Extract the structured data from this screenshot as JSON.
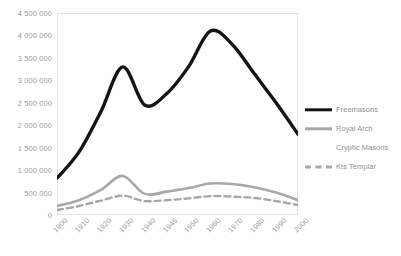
{
  "chart_data": {
    "type": "line",
    "title": "",
    "subtitle": "",
    "xlabel": "",
    "ylabel": "",
    "grid": false,
    "legend_position": "right",
    "x": [
      "1900",
      "1910",
      "1920",
      "1930",
      "1940",
      "1945",
      "1950",
      "1960",
      "1970",
      "1980",
      "1990",
      "2000"
    ],
    "categories": [
      "1900",
      "1910",
      "1920",
      "1930",
      "1940",
      "1945",
      "1950",
      "1960",
      "1970",
      "1980",
      "1990",
      "2000"
    ],
    "ylim": [
      0,
      4500000
    ],
    "ytick_values": [
      0,
      500000,
      1000000,
      1500000,
      2000000,
      2500000,
      3000000,
      3500000,
      4000000,
      4500000
    ],
    "ytick_labels": [
      "0",
      "500 000",
      "1 000 000",
      "1 500 000",
      "2 000 000",
      "2 500 000",
      "3 000 000",
      "3 500 000",
      "4 000 000",
      "4 500 000"
    ],
    "series": [
      {
        "name": "Freemasons",
        "color": "#141414",
        "style": "solid",
        "width": 3.4,
        "values": [
          820000,
          1400000,
          2300000,
          3300000,
          2450000,
          2700000,
          3300000,
          4100000,
          3800000,
          3150000,
          2500000,
          1800000
        ]
      },
      {
        "name": "Royal Arch",
        "color": "#a8a8a8",
        "style": "solid",
        "width": 2.6,
        "values": [
          200000,
          330000,
          560000,
          870000,
          470000,
          520000,
          600000,
          700000,
          690000,
          620000,
          500000,
          330000
        ]
      },
      {
        "name": "Cryptic Masons",
        "color": "#d9d9d9",
        "style": "none",
        "width": 0,
        "values": [
          null,
          null,
          null,
          null,
          null,
          null,
          null,
          null,
          null,
          null,
          null,
          null
        ]
      },
      {
        "name": "Kts Templar",
        "color": "#a8a8a8",
        "style": "dashed",
        "width": 2.4,
        "values": [
          110000,
          200000,
          320000,
          430000,
          310000,
          330000,
          370000,
          420000,
          410000,
          380000,
          310000,
          220000
        ]
      }
    ]
  },
  "legend": {
    "items": [
      {
        "label": "Freemasons",
        "swatch": "solid-black"
      },
      {
        "label": "Royal Arch",
        "swatch": "solid-gray"
      },
      {
        "label": "Cryptic Masons",
        "swatch": "none"
      },
      {
        "label": "Kts Templar",
        "swatch": "dashed-gray"
      }
    ]
  },
  "colors": {
    "freemasons": "#141414",
    "royal_arch": "#a8a8a8",
    "cryptic_masons": "#d9d9d9",
    "kts_templar": "#a8a8a8",
    "axis_text": "#9b9b9b",
    "plot_border": "#e3e3e3",
    "background": "#ffffff"
  }
}
